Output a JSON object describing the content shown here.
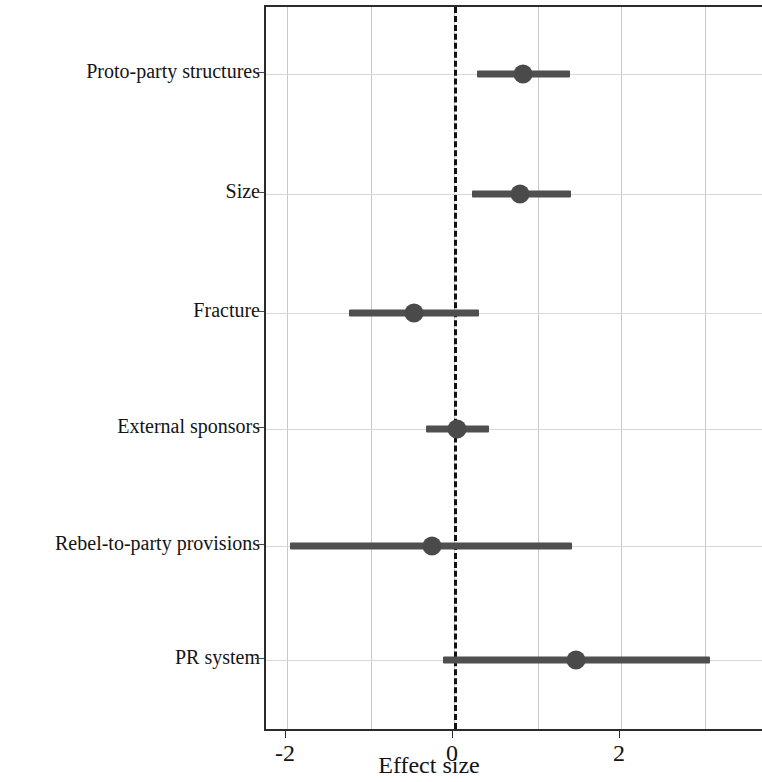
{
  "chart_data": {
    "type": "scatter",
    "subtype": "forest-plot",
    "title": "",
    "xlabel": "Effect size",
    "ylabel": "",
    "xlim": [
      -2.25,
      3.71
    ],
    "xticks": [
      -2,
      0,
      2
    ],
    "xtick_labels": [
      "-2",
      "0",
      "2"
    ],
    "gridlines_x": [
      -2,
      -1,
      0,
      1,
      2,
      3
    ],
    "grid": true,
    "legend": "none",
    "reference_line": {
      "value": 0,
      "style": "dashed",
      "color": "#111111"
    },
    "categories": [
      "Proto-party structures",
      "Size",
      "Fracture",
      "External sponsors",
      "Rebel-to-party provisions",
      "PR system"
    ],
    "values": [
      0.83,
      0.79,
      -0.48,
      0.04,
      -0.26,
      1.46
    ],
    "ci_low": [
      0.28,
      0.22,
      -1.26,
      -0.33,
      -1.96,
      -0.13
    ],
    "ci_high": [
      1.39,
      1.4,
      0.3,
      0.42,
      1.41,
      3.07
    ],
    "point_color": "#4a4a4a",
    "interval_color": "#4f4f4f"
  },
  "axis": {
    "x_title": "Effect size",
    "tick_labels": [
      "-2",
      "0",
      "2"
    ]
  },
  "rows": [
    {
      "label": "Proto-party structures",
      "estimate": 0.83,
      "low": 0.28,
      "high": 1.39
    },
    {
      "label": "Size",
      "estimate": 0.79,
      "low": 0.22,
      "high": 1.4
    },
    {
      "label": "Fracture",
      "estimate": -0.48,
      "low": -1.26,
      "high": 0.3
    },
    {
      "label": "External sponsors",
      "estimate": 0.04,
      "low": -0.33,
      "high": 0.42
    },
    {
      "label": "Rebel-to-party provisions",
      "estimate": -0.26,
      "low": -1.96,
      "high": 1.41
    },
    {
      "label": "PR system",
      "estimate": 1.46,
      "low": -0.13,
      "high": 3.07
    }
  ]
}
